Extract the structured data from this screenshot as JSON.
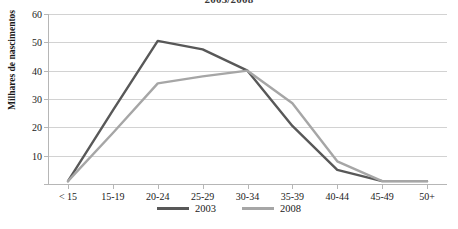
{
  "chart_data": {
    "type": "line",
    "title": "2003/2008",
    "xlabel": "",
    "ylabel": "Milhares de nascimentos",
    "categories": [
      "< 15",
      "15-19",
      "20-24",
      "25-29",
      "30-34",
      "35-39",
      "40-44",
      "45-49",
      "50+"
    ],
    "series": [
      {
        "name": "2003",
        "color": "#585858",
        "values": [
          1,
          26,
          50.5,
          47.5,
          40,
          20.5,
          5,
          1,
          1
        ]
      },
      {
        "name": "2008",
        "color": "#a6a6a6",
        "values": [
          1,
          18,
          35.5,
          38,
          40,
          28.5,
          8,
          1,
          1
        ]
      }
    ],
    "ylim": [
      0,
      60
    ],
    "yticks": [
      0,
      10,
      20,
      30,
      40,
      50,
      60
    ],
    "ytick_labels": [
      "",
      "10",
      "20",
      "30",
      "40",
      "50",
      "60"
    ],
    "grid": true,
    "legend_position": "bottom"
  },
  "axis": {
    "gridline_color": "#d2d2d2",
    "axis_color": "#b6b6b6"
  }
}
